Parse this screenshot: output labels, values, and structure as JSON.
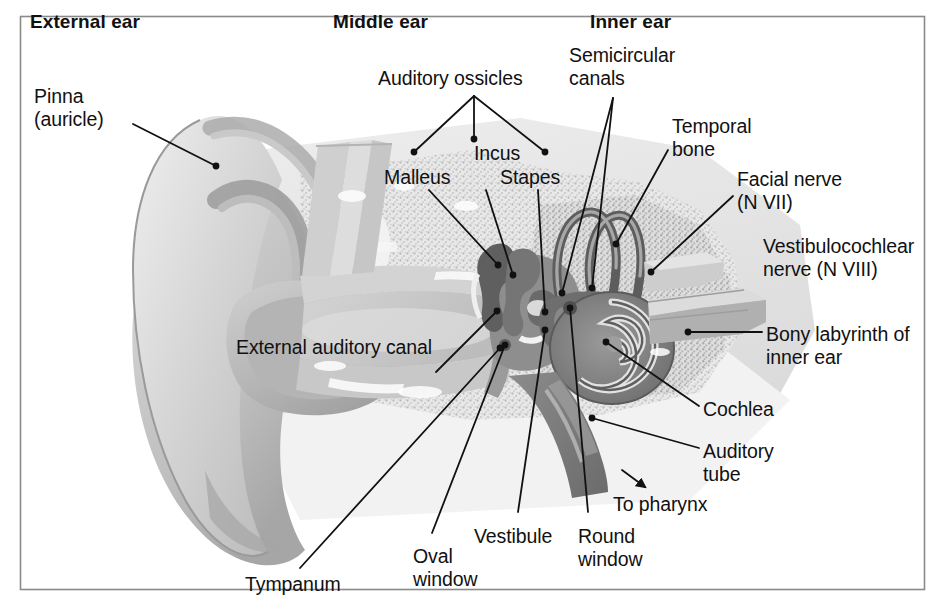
{
  "figure": {
    "frame": {
      "x": 20,
      "y": 16,
      "width": 905,
      "height": 574,
      "border_color": "#808080"
    },
    "background_color": "#ffffff",
    "ink_color": "#111111"
  },
  "palette": {
    "line": "#111111",
    "frame": "#8a8a8a",
    "bone_light": "#e3e3e3",
    "bone_mid": "#cfcfcf",
    "bone_speckle": "#bdbdbd",
    "cartilage_light": "#dcdcdc",
    "cartilage_mid": "#c2c2c2",
    "cartilage_dark": "#a8a8a8",
    "canal_fill": "#b5b5b5",
    "dark_tissue": "#6f6f6f",
    "mid_tissue": "#8f8f8f",
    "highlight": "#f4f4f4",
    "white": "#ffffff"
  },
  "section_headings": [
    {
      "id": "external-ear",
      "text": "External ear",
      "x": 30,
      "y": 10
    },
    {
      "id": "middle-ear",
      "text": "Middle ear",
      "x": 333,
      "y": 10
    },
    {
      "id": "inner-ear",
      "text": "Inner ear",
      "x": 590,
      "y": 10
    }
  ],
  "labels": [
    {
      "id": "pinna",
      "lines": [
        "Pinna",
        "(auricle)"
      ],
      "x": 34,
      "y": 85,
      "align": "left"
    },
    {
      "id": "auditory-ossicles",
      "lines": [
        "Auditory ossicles"
      ],
      "x": 378,
      "y": 67,
      "align": "left"
    },
    {
      "id": "incus",
      "lines": [
        "Incus"
      ],
      "x": 474,
      "y": 142,
      "align": "left"
    },
    {
      "id": "malleus",
      "lines": [
        "Malleus"
      ],
      "x": 384,
      "y": 166,
      "align": "left"
    },
    {
      "id": "stapes",
      "lines": [
        "Stapes"
      ],
      "x": 500,
      "y": 166,
      "align": "left"
    },
    {
      "id": "semicircular-canals",
      "lines": [
        "Semicircular",
        "canals"
      ],
      "x": 569,
      "y": 44,
      "align": "left"
    },
    {
      "id": "temporal-bone",
      "lines": [
        "Temporal",
        "bone"
      ],
      "x": 672,
      "y": 115,
      "align": "left"
    },
    {
      "id": "facial-nerve",
      "lines": [
        "Facial nerve",
        "(N VII)"
      ],
      "x": 737,
      "y": 168,
      "align": "left"
    },
    {
      "id": "vestibulocochlear-nerve",
      "lines": [
        "Vestibulocochlear",
        "nerve (N VIII)"
      ],
      "x": 763,
      "y": 235,
      "align": "left"
    },
    {
      "id": "bony-labyrinth",
      "lines": [
        "Bony labyrinth of",
        "inner ear"
      ],
      "x": 766,
      "y": 323,
      "align": "left"
    },
    {
      "id": "external-auditory-canal",
      "lines": [
        "External auditory canal"
      ],
      "x": 236,
      "y": 336,
      "align": "left"
    },
    {
      "id": "cochlea",
      "lines": [
        "Cochlea"
      ],
      "x": 703,
      "y": 398,
      "align": "left"
    },
    {
      "id": "auditory-tube",
      "lines": [
        "Auditory",
        "tube"
      ],
      "x": 703,
      "y": 440,
      "align": "left"
    },
    {
      "id": "to-pharynx",
      "lines": [
        "To pharynx"
      ],
      "x": 613,
      "y": 493,
      "align": "left"
    },
    {
      "id": "vestibule",
      "lines": [
        "Vestibule"
      ],
      "x": 474,
      "y": 525,
      "align": "left"
    },
    {
      "id": "round-window",
      "lines": [
        "Round",
        "window"
      ],
      "x": 578,
      "y": 525,
      "align": "left"
    },
    {
      "id": "oval-window",
      "lines": [
        "Oval",
        "window"
      ],
      "x": 413,
      "y": 545,
      "align": "left"
    },
    {
      "id": "tympanum",
      "lines": [
        "Tympanum"
      ],
      "x": 245,
      "y": 573,
      "align": "left"
    }
  ],
  "leaders": [
    {
      "id": "leader-pinna",
      "target": "pinna",
      "points": "133,124 216,166",
      "dot": "216,166"
    },
    {
      "id": "leader-ossicles-stem",
      "target": "auditory-ossicles",
      "points": "474,96 474,139",
      "dot": "474,139"
    },
    {
      "id": "leader-ossicles-left",
      "target": "auditory-ossicles",
      "points": "474,96 414,152",
      "dot": "414,152"
    },
    {
      "id": "leader-ossicles-right",
      "target": "auditory-ossicles",
      "points": "474,96 545,152",
      "dot": "545,152"
    },
    {
      "id": "leader-malleus",
      "target": "malleus",
      "points": "429,190 498,265",
      "dot": "498,265"
    },
    {
      "id": "leader-incus",
      "target": "incus",
      "points": "486,190 513,275",
      "dot": "513,275"
    },
    {
      "id": "leader-stapes",
      "target": "stapes",
      "points": "538,190 545,312",
      "dot": "545,312"
    },
    {
      "id": "leader-semicircular-a",
      "target": "semicircular-canals",
      "points": "613,98 562,293",
      "dot": "562,293"
    },
    {
      "id": "leader-semicircular-b",
      "target": "semicircular-canals",
      "points": "613,98 592,288",
      "dot": "592,288"
    },
    {
      "id": "leader-temporal-bone",
      "target": "temporal-bone",
      "points": "668,150 616,244",
      "dot": "616,244"
    },
    {
      "id": "leader-facial-nerve",
      "target": "facial-nerve",
      "points": "733,196 651,272",
      "dot": "651,272"
    },
    {
      "id": "leader-bony-labyrinth",
      "target": "bony-labyrinth",
      "points": "762,332 688,332",
      "dot": "688,332"
    },
    {
      "id": "leader-external-auditory-canal",
      "target": "external-auditory-canal",
      "points": "497,311 436,372",
      "dot": "497,311"
    },
    {
      "id": "leader-cochlea",
      "target": "cochlea",
      "points": "699,406 606,342",
      "dot": "606,342"
    },
    {
      "id": "leader-auditory-tube",
      "target": "auditory-tube",
      "points": "699,448 592,418",
      "dot": "592,418"
    },
    {
      "id": "leader-to-pharynx",
      "target": "to-pharynx",
      "points": "622,470 645,487",
      "arrow": true
    },
    {
      "id": "leader-vestibule",
      "target": "vestibule",
      "points": "518,512 545,330",
      "dot": "545,330"
    },
    {
      "id": "leader-round-window",
      "target": "round-window",
      "points": "588,512 570,308",
      "dot": "570,308"
    },
    {
      "id": "leader-oval-window",
      "target": "oval-window",
      "points": "432,533 505,345",
      "dot": "505,345"
    },
    {
      "id": "leader-tympanum",
      "target": "tympanum",
      "points": "300,568 500,348",
      "dot": "500,348"
    }
  ]
}
